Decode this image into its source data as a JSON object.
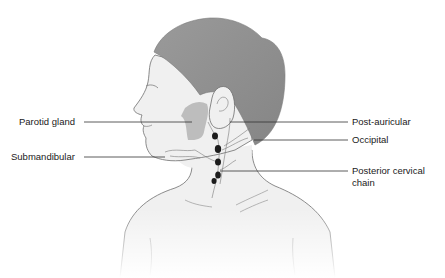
{
  "figure": {
    "colors": {
      "skin": "#f0f0f0",
      "hair": "#8f8f8f",
      "gland": "#bdbdbd",
      "outline": "#6e6e6e",
      "node": "#1c1c1c",
      "leader": "#333333",
      "text": "#1a1a1a"
    }
  },
  "labels": {
    "left": [
      {
        "id": "parotid",
        "text": "Parotid gland"
      },
      {
        "id": "submandibular",
        "text": "Submandibular"
      }
    ],
    "right": [
      {
        "id": "post_auricular",
        "text": "Post-auricular"
      },
      {
        "id": "occipital",
        "text": "Occipital"
      },
      {
        "id": "posterior_cervical_1",
        "text": "Posterior cervical"
      },
      {
        "id": "posterior_cervical_2",
        "text": "chain"
      }
    ]
  }
}
